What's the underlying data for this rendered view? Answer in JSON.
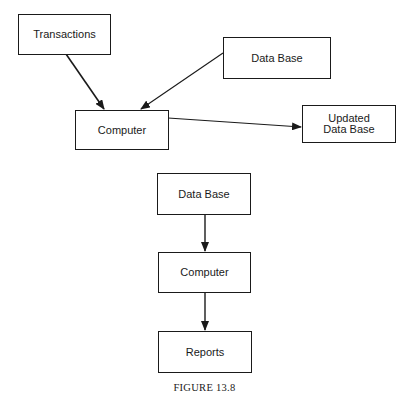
{
  "diagram": {
    "top": {
      "nodes": [
        {
          "id": "transactions",
          "label": "Transactions"
        },
        {
          "id": "database",
          "label": "Data Base"
        },
        {
          "id": "computer",
          "label": "Computer"
        },
        {
          "id": "updated_database",
          "label_line1": "Updated",
          "label_line2": "Data Base"
        }
      ],
      "edges": [
        {
          "from": "transactions",
          "to": "computer"
        },
        {
          "from": "database",
          "to": "computer"
        },
        {
          "from": "computer",
          "to": "updated_database"
        }
      ]
    },
    "bottom": {
      "nodes": [
        {
          "id": "database",
          "label": "Data Base"
        },
        {
          "id": "computer",
          "label": "Computer"
        },
        {
          "id": "reports",
          "label": "Reports"
        }
      ],
      "edges": [
        {
          "from": "database",
          "to": "computer"
        },
        {
          "from": "computer",
          "to": "reports"
        }
      ]
    },
    "caption": "FIGURE 13.8"
  }
}
